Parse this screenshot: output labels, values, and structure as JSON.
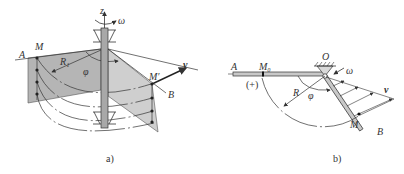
{
  "figure_a": {
    "caption": "a)",
    "labels": {
      "A": "A",
      "M": "M",
      "M_prime": "M′",
      "B": "B",
      "R1": "R₁",
      "phi": "φ",
      "z": "z",
      "omega": "ω",
      "v": "v"
    }
  },
  "figure_b": {
    "caption": "b)",
    "labels": {
      "A": "A",
      "M0": "M₀",
      "plus": "(+)",
      "O": "O",
      "omega": "ω",
      "R": "R",
      "phi": "φ",
      "v": "v",
      "M": "M",
      "B": "B"
    }
  },
  "colors": {
    "line": "#333333",
    "plane_fill": "#b8b8b8",
    "plane_fill_light": "#d0d0d0",
    "shaft_fill": "#a8a8a8"
  }
}
